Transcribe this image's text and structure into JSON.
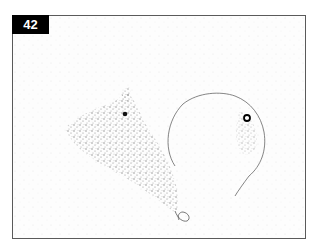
{
  "figure": {
    "panel_label": "42",
    "colors": {
      "label_bg": "#000000",
      "label_text": "#ffffff",
      "border": "#5a5a5a",
      "background": "#fdfdfd",
      "stipple": "#6a6a6a"
    },
    "content": {
      "left_object": "stippled-cell-mass",
      "right_object": "outlined-round-cell",
      "markers": [
        "dark-dot-left",
        "ringed-dot-right"
      ]
    }
  }
}
